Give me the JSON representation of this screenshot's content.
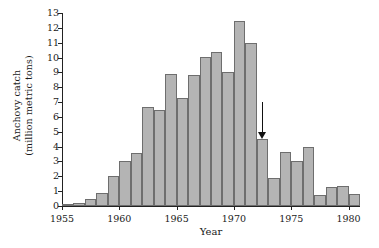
{
  "chart_data": {
    "type": "bar",
    "title": "",
    "xlabel": "Year",
    "ylabel_lines": [
      "Anchovy catch",
      "(million metric tons)"
    ],
    "ylabel": "Anchovy catch (million metric tons)",
    "ylim": [
      0,
      13
    ],
    "xlim": [
      1955,
      1981
    ],
    "grid": false,
    "legend": null,
    "yticks": [
      0,
      1,
      2,
      3,
      4,
      5,
      6,
      7,
      8,
      9,
      10,
      11,
      12,
      13
    ],
    "ytick_labels": [
      "0",
      "1",
      "2",
      "3",
      "4",
      "5",
      "6",
      "7",
      "8",
      "9",
      "10",
      "11",
      "12",
      "13"
    ],
    "xticks": [
      1955,
      1960,
      1965,
      1970,
      1975,
      1980
    ],
    "xtick_labels": [
      "1955",
      "1960",
      "1965",
      "1970",
      "1975",
      "1980"
    ],
    "categories": [
      1955,
      1956,
      1957,
      1958,
      1959,
      1960,
      1961,
      1962,
      1963,
      1964,
      1965,
      1966,
      1967,
      1968,
      1969,
      1970,
      1971,
      1972,
      1973,
      1974,
      1975,
      1976,
      1977,
      1978,
      1979,
      1980
    ],
    "values": [
      0.1,
      0.2,
      0.5,
      0.9,
      2.0,
      3.0,
      3.6,
      6.7,
      6.5,
      8.9,
      7.3,
      8.8,
      10.05,
      10.35,
      9.05,
      12.45,
      10.95,
      4.5,
      1.9,
      3.65,
      3.0,
      4.0,
      0.75,
      1.25,
      1.35,
      0.8
    ],
    "bar_color": "#b4b4b4",
    "bar_edge_color": "#6e6e6e",
    "annotations": [
      {
        "type": "arrow",
        "direction": "down",
        "points_to_year": 1972,
        "points_to_value": 4.5,
        "tail_value": 7.0,
        "color": "#111111"
      }
    ]
  }
}
